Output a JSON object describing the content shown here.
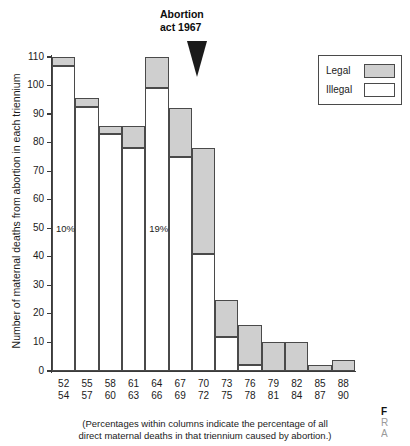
{
  "annotation": {
    "line1": "Abortion",
    "line2": "act 1967",
    "marker": "down-triangle"
  },
  "legend": {
    "position": "top-right",
    "items": [
      {
        "label": "Legal",
        "color": "#cfcfcf"
      },
      {
        "label": "Illegal",
        "color": "#ffffff"
      }
    ]
  },
  "caption": {
    "line1": "(Percentages within columns indicate the percentage of all",
    "line2": "direct maternal deaths in that triennium caused by abortion.)"
  },
  "side_text": {
    "l1": "F",
    "l2": "R",
    "l3": "A"
  },
  "chart_data": {
    "type": "bar",
    "title": "",
    "xlabel": "",
    "ylabel": "Number of maternal deaths from abortion in each triennium",
    "ylim": [
      0,
      110
    ],
    "ytick_step": 10,
    "yticks": [
      0,
      10,
      20,
      30,
      40,
      50,
      60,
      70,
      80,
      90,
      100,
      110
    ],
    "grid": false,
    "stacked": true,
    "legend_position": "top-right",
    "categories": [
      "52-54",
      "55-57",
      "58-60",
      "61-63",
      "64-66",
      "67-69",
      "70-72",
      "73-75",
      "76-78",
      "79-81",
      "82-84",
      "85-87",
      "88-90"
    ],
    "category_labels_top": [
      "52",
      "55",
      "58",
      "61",
      "64",
      "67",
      "70",
      "73",
      "76",
      "79",
      "82",
      "85",
      "88"
    ],
    "category_labels_bottom": [
      "54",
      "57",
      "60",
      "63",
      "66",
      "69",
      "72",
      "75",
      "78",
      "81",
      "84",
      "87",
      "90"
    ],
    "series": [
      {
        "name": "Illegal",
        "color": "#ffffff",
        "values": [
          107,
          92.5,
          83,
          78,
          99,
          75,
          41,
          12,
          2,
          0,
          0,
          0,
          0
        ]
      },
      {
        "name": "Legal",
        "color": "#cfcfcf",
        "values": [
          3,
          3,
          3,
          8,
          11,
          17,
          37,
          13,
          14,
          10,
          10,
          2,
          4
        ]
      }
    ],
    "totals": [
      110,
      95.5,
      86,
      86,
      110,
      92,
      78,
      25,
      16,
      10,
      10,
      2,
      4
    ],
    "annotations": [
      {
        "text": "10%",
        "category": "52-54",
        "value": 50
      },
      {
        "text": "19%",
        "category": "64-66",
        "value": 50
      },
      {
        "text": "Abortion act 1967",
        "category": "67-69",
        "type": "marker"
      }
    ]
  }
}
